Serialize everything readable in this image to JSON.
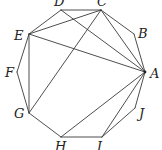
{
  "diagram": {
    "type": "regular-decagon-with-diagonals",
    "vertices": [
      {
        "name": "A",
        "x": 145,
        "y": 72,
        "lx": 150,
        "ly": 78
      },
      {
        "name": "B",
        "x": 134,
        "y": 34,
        "lx": 138,
        "ly": 38
      },
      {
        "name": "C",
        "x": 101,
        "y": 10,
        "lx": 97,
        "ly": 6
      },
      {
        "name": "D",
        "x": 61,
        "y": 10,
        "lx": 54,
        "ly": 6
      },
      {
        "name": "E",
        "x": 29,
        "y": 34,
        "lx": 14,
        "ly": 40
      },
      {
        "name": "F",
        "x": 17,
        "y": 72,
        "lx": 5,
        "ly": 77
      },
      {
        "name": "G",
        "x": 29,
        "y": 113,
        "lx": 14,
        "ly": 118
      },
      {
        "name": "H",
        "x": 61,
        "y": 137,
        "lx": 55,
        "ly": 151
      },
      {
        "name": "I",
        "x": 102,
        "y": 137,
        "lx": 97,
        "ly": 151
      },
      {
        "name": "J",
        "x": 135,
        "y": 108,
        "lx": 139,
        "ly": 118
      }
    ],
    "sides": [
      [
        "A",
        "B"
      ],
      [
        "B",
        "C"
      ],
      [
        "C",
        "D"
      ],
      [
        "D",
        "E"
      ],
      [
        "E",
        "F"
      ],
      [
        "F",
        "G"
      ],
      [
        "G",
        "H"
      ],
      [
        "H",
        "I"
      ],
      [
        "I",
        "J"
      ],
      [
        "J",
        "A"
      ]
    ],
    "diagonals": [
      [
        "A",
        "C"
      ],
      [
        "A",
        "D"
      ],
      [
        "A",
        "E"
      ],
      [
        "A",
        "H"
      ],
      [
        "A",
        "I"
      ],
      [
        "C",
        "E"
      ],
      [
        "C",
        "G"
      ],
      [
        "E",
        "G"
      ]
    ],
    "highlighted_point": "A",
    "line_color": "#3a3a3a",
    "label_color": "#222222"
  }
}
